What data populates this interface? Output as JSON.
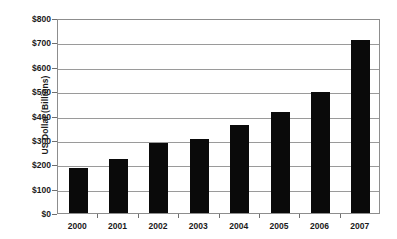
{
  "chart_data": {
    "type": "bar",
    "title": "",
    "subtitle": "",
    "xlabel": "",
    "ylabel": "US Dollar (Billions)",
    "categories": [
      "2000",
      "2001",
      "2002",
      "2003",
      "2004",
      "2005",
      "2006",
      "2007"
    ],
    "values": [
      184,
      222,
      287,
      303,
      360,
      414,
      497,
      710
    ],
    "series": [
      {
        "name": "US Dollar (Billions)",
        "values": [
          184,
          222,
          287,
          303,
          360,
          414,
          497,
          710
        ]
      }
    ],
    "ylim": [
      0,
      800
    ],
    "ytick_values": [
      0,
      100,
      200,
      300,
      400,
      500,
      600,
      700,
      800
    ],
    "ytick_labels": [
      "$0",
      "$100",
      "$200",
      "$300",
      "$400",
      "$500",
      "$600",
      "$700",
      "$800"
    ],
    "grid": true,
    "legend": false,
    "legend_position": "none",
    "bar_color": "#0a0a0a",
    "grid_color": "#9a9a9a",
    "axis_color": "#8d8d8d",
    "background_color": "#ffffff"
  }
}
